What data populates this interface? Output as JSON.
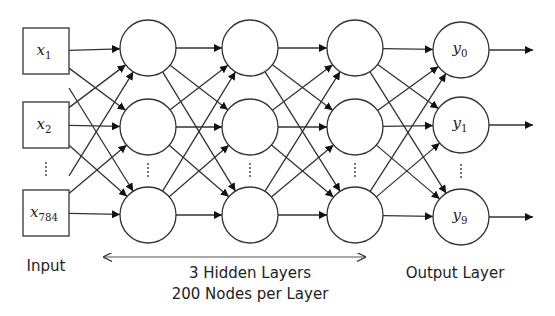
{
  "diagram": {
    "type": "neural-network",
    "input_layer": {
      "label": "Input",
      "nodes": [
        {
          "base": "x",
          "sub": "1"
        },
        {
          "base": "x",
          "sub": "2"
        },
        {
          "ellipsis": true
        },
        {
          "base": "x",
          "sub": "784"
        }
      ]
    },
    "hidden_layers": {
      "count_label": "3 Hidden Layers",
      "nodes_label": "200 Nodes per Layer",
      "layers": 3,
      "visible_nodes_per_layer": 3
    },
    "output_layer": {
      "label": "Output Layer",
      "nodes": [
        {
          "base": "y",
          "sub": "0"
        },
        {
          "base": "y",
          "sub": "1"
        },
        {
          "ellipsis": true
        },
        {
          "base": "y",
          "sub": "9"
        }
      ]
    },
    "colors": {
      "stroke": "#333333",
      "background": "#ffffff",
      "text": "#222222"
    }
  }
}
